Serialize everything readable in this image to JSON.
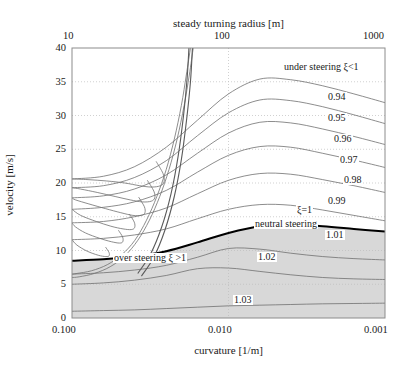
{
  "chart_data": {
    "type": "line",
    "title": "",
    "xlabel": "curvature [1/m]",
    "ylabel": "velocity [m/s]",
    "top_axis_label": "steady turning radius [m]",
    "xscale": "log-reversed",
    "xlim": [
      0.1,
      0.001
    ],
    "ylim": [
      0,
      40
    ],
    "xticks": [
      "0.100",
      "0.010",
      "0.001"
    ],
    "top_xticks": [
      "10",
      "100",
      "1000"
    ],
    "yticks": [
      "0",
      "5",
      "10",
      "15",
      "20",
      "25",
      "30",
      "35",
      "40"
    ],
    "grid": true,
    "legend": "none",
    "annotations": [
      {
        "text": "under steering  ξ<1",
        "x": 0.0032,
        "y": 36.2
      },
      {
        "text": "neutral steering",
        "x": 0.0038,
        "y": 13.6
      },
      {
        "text": "over steering    ξ >1",
        "x": 0.028,
        "y": 6.4
      }
    ],
    "contour_labels": [
      {
        "text": "0.94",
        "value": 0.94,
        "x": 0.00175,
        "y": 31.5
      },
      {
        "text": "0.95",
        "value": 0.95,
        "x": 0.00175,
        "y": 28.3
      },
      {
        "text": "0.96",
        "value": 0.96,
        "x": 0.00155,
        "y": 25.2
      },
      {
        "text": "0.97",
        "value": 0.97,
        "x": 0.00142,
        "y": 22.1
      },
      {
        "text": "0.98",
        "value": 0.98,
        "x": 0.00135,
        "y": 19.0
      },
      {
        "text": "0.99",
        "value": 0.99,
        "x": 0.00175,
        "y": 16.0
      },
      {
        "text": "ξ=1",
        "value": 1.0,
        "x": 0.0033,
        "y": 15.1
      },
      {
        "text": "1.01",
        "value": 1.01,
        "x": 0.00155,
        "y": 11.6
      },
      {
        "text": "1.02",
        "value": 1.02,
        "x": 0.0048,
        "y": 8.6
      },
      {
        "text": "1.03",
        "value": 1.03,
        "x": 0.0062,
        "y": 2.9
      }
    ],
    "series": [
      {
        "name": "0.94",
        "label": "0.94",
        "weight": "thin",
        "points": [
          [
            0.1,
            20.6
          ],
          [
            0.063,
            21.0
          ],
          [
            0.04,
            22.4
          ],
          [
            0.025,
            25.3
          ],
          [
            0.0158,
            29.3
          ],
          [
            0.01,
            33.2
          ],
          [
            0.0063,
            35.4
          ],
          [
            0.004,
            35.3
          ],
          [
            0.0025,
            34.4
          ],
          [
            0.00158,
            33.2
          ],
          [
            0.001,
            31.9
          ]
        ]
      },
      {
        "name": "0.95",
        "label": "0.95",
        "weight": "thin",
        "points": [
          [
            0.1,
            19.3
          ],
          [
            0.063,
            19.6
          ],
          [
            0.04,
            20.8
          ],
          [
            0.025,
            23.3
          ],
          [
            0.0158,
            27.0
          ],
          [
            0.01,
            30.4
          ],
          [
            0.0063,
            32.3
          ],
          [
            0.004,
            32.2
          ],
          [
            0.0025,
            31.3
          ],
          [
            0.00158,
            30.1
          ],
          [
            0.001,
            28.8
          ]
        ]
      },
      {
        "name": "0.96",
        "label": "0.96",
        "weight": "thin",
        "points": [
          [
            0.1,
            17.8
          ],
          [
            0.063,
            18.1
          ],
          [
            0.04,
            19.1
          ],
          [
            0.025,
            21.2
          ],
          [
            0.0158,
            24.4
          ],
          [
            0.01,
            27.4
          ],
          [
            0.0063,
            29.0
          ],
          [
            0.004,
            28.9
          ],
          [
            0.0025,
            28.0
          ],
          [
            0.00158,
            26.9
          ],
          [
            0.001,
            25.7
          ]
        ]
      },
      {
        "name": "0.97",
        "label": "0.97",
        "weight": "thin",
        "points": [
          [
            0.1,
            16.1
          ],
          [
            0.063,
            16.4
          ],
          [
            0.04,
            17.2
          ],
          [
            0.025,
            18.9
          ],
          [
            0.0158,
            21.6
          ],
          [
            0.01,
            24.1
          ],
          [
            0.0063,
            25.4
          ],
          [
            0.004,
            25.3
          ],
          [
            0.0025,
            24.4
          ],
          [
            0.00158,
            23.4
          ],
          [
            0.001,
            22.3
          ]
        ]
      },
      {
        "name": "0.98",
        "label": "0.98",
        "weight": "thin",
        "points": [
          [
            0.1,
            14.1
          ],
          [
            0.063,
            14.3
          ],
          [
            0.04,
            15.0
          ],
          [
            0.025,
            16.3
          ],
          [
            0.0158,
            18.4
          ],
          [
            0.01,
            20.4
          ],
          [
            0.0063,
            21.4
          ],
          [
            0.004,
            21.3
          ],
          [
            0.0025,
            20.5
          ],
          [
            0.00158,
            19.6
          ],
          [
            0.001,
            18.6
          ]
        ]
      },
      {
        "name": "0.99",
        "label": "0.99",
        "weight": "thin",
        "points": [
          [
            0.1,
            11.6
          ],
          [
            0.063,
            11.8
          ],
          [
            0.04,
            12.3
          ],
          [
            0.025,
            13.2
          ],
          [
            0.0158,
            14.7
          ],
          [
            0.01,
            16.1
          ],
          [
            0.0063,
            16.8
          ],
          [
            0.004,
            16.7
          ],
          [
            0.0025,
            16.0
          ],
          [
            0.00158,
            15.2
          ],
          [
            0.001,
            14.4
          ]
        ]
      },
      {
        "name": "xi=1",
        "label": "ξ=1",
        "weight": "bold",
        "points": [
          [
            0.1,
            8.5
          ],
          [
            0.063,
            8.7
          ],
          [
            0.04,
            9.1
          ],
          [
            0.025,
            9.9
          ],
          [
            0.0158,
            11.2
          ],
          [
            0.01,
            12.6
          ],
          [
            0.0063,
            13.6
          ],
          [
            0.004,
            13.8
          ],
          [
            0.0025,
            13.6
          ],
          [
            0.00158,
            13.2
          ],
          [
            0.001,
            12.8
          ]
        ]
      },
      {
        "name": "1.01",
        "label": "1.01",
        "weight": "thin",
        "points": [
          [
            0.1,
            6.5
          ],
          [
            0.063,
            6.7
          ],
          [
            0.04,
            7.1
          ],
          [
            0.025,
            7.8
          ],
          [
            0.0158,
            9.0
          ],
          [
            0.01,
            10.3
          ],
          [
            0.0063,
            10.2
          ],
          [
            0.004,
            9.6
          ],
          [
            0.0025,
            9.1
          ],
          [
            0.00158,
            8.8
          ],
          [
            0.001,
            8.6
          ]
        ]
      },
      {
        "name": "1.02",
        "label": "1.02",
        "weight": "thin",
        "points": [
          [
            0.1,
            5.0
          ],
          [
            0.063,
            5.2
          ],
          [
            0.04,
            5.6
          ],
          [
            0.025,
            6.3
          ],
          [
            0.0158,
            7.3
          ],
          [
            0.01,
            7.4
          ],
          [
            0.0063,
            6.9
          ],
          [
            0.004,
            6.4
          ],
          [
            0.0025,
            6.0
          ],
          [
            0.00158,
            5.8
          ],
          [
            0.001,
            5.7
          ]
        ]
      },
      {
        "name": "1.03",
        "label": "1.03",
        "weight": "thin",
        "points": [
          [
            0.1,
            1.0
          ],
          [
            0.063,
            1.1
          ],
          [
            0.04,
            1.2
          ],
          [
            0.025,
            1.4
          ],
          [
            0.0158,
            1.6
          ],
          [
            0.01,
            1.8
          ],
          [
            0.0063,
            1.9
          ],
          [
            0.004,
            2.0
          ],
          [
            0.0025,
            2.1
          ],
          [
            0.00158,
            2.15
          ],
          [
            0.001,
            2.2
          ]
        ]
      }
    ],
    "branch_curves": [
      {
        "name": "branch-upper-a",
        "points": [
          [
            0.0168,
            40.0
          ],
          [
            0.0178,
            36.0
          ],
          [
            0.0192,
            31.5
          ],
          [
            0.0213,
            26.5
          ],
          [
            0.024,
            22.0
          ],
          [
            0.0275,
            18.0
          ],
          [
            0.032,
            14.5
          ],
          [
            0.038,
            11.5
          ],
          [
            0.046,
            9.2
          ],
          [
            0.057,
            7.6
          ],
          [
            0.072,
            6.6
          ],
          [
            0.09,
            6.1
          ],
          [
            0.1,
            6.0
          ]
        ]
      },
      {
        "name": "branch-upper-b",
        "points": [
          [
            0.0175,
            40.0
          ],
          [
            0.0186,
            36.0
          ],
          [
            0.02,
            31.5
          ],
          [
            0.0222,
            26.5
          ],
          [
            0.025,
            22.0
          ],
          [
            0.0287,
            18.0
          ],
          [
            0.0334,
            14.5
          ],
          [
            0.0397,
            11.5
          ],
          [
            0.048,
            9.4
          ],
          [
            0.0595,
            7.9
          ],
          [
            0.075,
            7.0
          ],
          [
            0.093,
            6.6
          ],
          [
            0.1,
            6.5
          ]
        ]
      },
      {
        "name": "branch-fold-0.94",
        "points": [
          [
            0.029,
            23.2
          ],
          [
            0.0262,
            21.4
          ],
          [
            0.0258,
            20.2
          ],
          [
            0.0272,
            19.6
          ],
          [
            0.031,
            19.4
          ],
          [
            0.037,
            19.6
          ],
          [
            0.046,
            20.0
          ],
          [
            0.06,
            20.3
          ],
          [
            0.079,
            20.5
          ],
          [
            0.1,
            20.6
          ]
        ]
      },
      {
        "name": "branch-fold-0.95",
        "points": [
          [
            0.033,
            20.4
          ],
          [
            0.03,
            18.8
          ],
          [
            0.0296,
            17.8
          ],
          [
            0.0312,
            17.3
          ],
          [
            0.0355,
            17.2
          ],
          [
            0.0425,
            17.5
          ],
          [
            0.053,
            18.0
          ],
          [
            0.069,
            18.6
          ],
          [
            0.088,
            19.1
          ],
          [
            0.1,
            19.3
          ]
        ]
      },
      {
        "name": "branch-fold-0.96",
        "points": [
          [
            0.0375,
            17.9
          ],
          [
            0.0345,
            16.5
          ],
          [
            0.0342,
            15.6
          ],
          [
            0.036,
            15.2
          ],
          [
            0.0408,
            15.2
          ],
          [
            0.0488,
            15.6
          ],
          [
            0.061,
            16.2
          ],
          [
            0.078,
            16.9
          ],
          [
            0.095,
            17.5
          ],
          [
            0.1,
            17.8
          ]
        ]
      },
      {
        "name": "branch-fold-0.97",
        "points": [
          [
            0.043,
            15.4
          ],
          [
            0.04,
            14.2
          ],
          [
            0.0398,
            13.4
          ],
          [
            0.0418,
            13.1
          ],
          [
            0.0472,
            13.2
          ],
          [
            0.0565,
            13.6
          ],
          [
            0.07,
            14.3
          ],
          [
            0.088,
            15.2
          ],
          [
            0.1,
            16.1
          ]
        ]
      },
      {
        "name": "branch-fold-0.98",
        "points": [
          [
            0.0505,
            13.0
          ],
          [
            0.0475,
            12.0
          ],
          [
            0.0474,
            11.3
          ],
          [
            0.0497,
            11.1
          ],
          [
            0.056,
            11.3
          ],
          [
            0.0665,
            11.8
          ],
          [
            0.082,
            12.6
          ],
          [
            0.095,
            13.5
          ],
          [
            0.1,
            14.1
          ]
        ]
      },
      {
        "name": "branch-fold-0.99",
        "points": [
          [
            0.061,
            10.5
          ],
          [
            0.058,
            9.7
          ],
          [
            0.058,
            9.2
          ],
          [
            0.0608,
            9.1
          ],
          [
            0.068,
            9.3
          ],
          [
            0.08,
            9.9
          ],
          [
            0.093,
            10.8
          ],
          [
            0.1,
            11.6
          ]
        ]
      }
    ],
    "shaded_region": {
      "name": "over-steering-shaded",
      "color": "#d8d8d8",
      "description": "gray fill below the xi=1 neutral steering curve"
    }
  },
  "axes": {
    "top_title": "steady turning radius [m]",
    "bottom_title": "curvature [1/m]",
    "left_title": "velocity [m/s]",
    "top_ticks": [
      {
        "label": "10",
        "pos": 0.0
      },
      {
        "label": "100",
        "pos": 0.5
      },
      {
        "label": "1000",
        "pos": 1.0
      }
    ],
    "bottom_ticks": [
      {
        "label": "0.100",
        "pos": 0.0
      },
      {
        "label": "0.010",
        "pos": 0.5
      },
      {
        "label": "0.001",
        "pos": 1.0
      }
    ],
    "left_ticks": [
      {
        "label": "40",
        "value": 40
      },
      {
        "label": "35",
        "value": 35
      },
      {
        "label": "30",
        "value": 30
      },
      {
        "label": "25",
        "value": 25
      },
      {
        "label": "20",
        "value": 20
      },
      {
        "label": "15",
        "value": 15
      },
      {
        "label": "10",
        "value": 10
      },
      {
        "label": "5",
        "value": 5
      },
      {
        "label": "0",
        "value": 0
      }
    ]
  },
  "colors": {
    "background": "#ffffff",
    "axis": "#8c8c8c",
    "grid": "#bdbdbd",
    "contour": "#707070",
    "contour_bold": "#000000",
    "shade": "#d8d8d8",
    "text": "#1a1a1a"
  }
}
